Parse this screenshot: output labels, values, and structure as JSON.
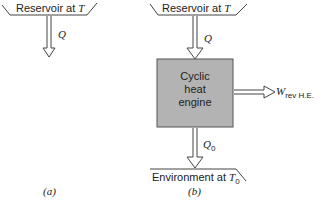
{
  "diagram_a": {
    "reservoir": {
      "label": "Reservoir at ",
      "temp": "T"
    },
    "heat_flow": "Q",
    "caption": "(a)"
  },
  "diagram_b": {
    "reservoir": {
      "label": "Reservoir at ",
      "temp": "T"
    },
    "heat_in": "Q",
    "engine": {
      "line1": "Cyclic",
      "line2": "heat",
      "line3": "engine"
    },
    "work": {
      "symbol": "W",
      "subscript": "rev H.E."
    },
    "heat_out": {
      "symbol": "Q",
      "subscript": "0"
    },
    "environment": {
      "label": "Environment at ",
      "temp": "T",
      "temp_sub": "0"
    },
    "caption": "(b)"
  },
  "colors": {
    "engine_fill": "#b3b3b3",
    "stroke": "#444444"
  }
}
